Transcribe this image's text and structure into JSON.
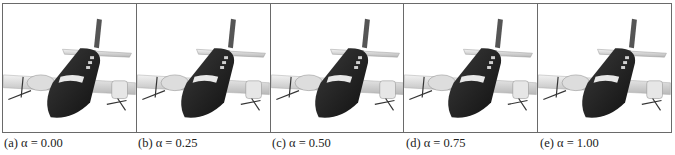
{
  "figure": {
    "panels": [
      {
        "label": "(a) α = 0.00",
        "alpha": 0.0
      },
      {
        "label": "(b) α = 0.25",
        "alpha": 0.25
      },
      {
        "label": "(c) α = 0.50",
        "alpha": 0.5
      },
      {
        "label": "(d) α = 0.75",
        "alpha": 0.75
      },
      {
        "label": "(e) α = 1.00",
        "alpha": 1.0
      }
    ],
    "image_subject": "airplane-render"
  }
}
